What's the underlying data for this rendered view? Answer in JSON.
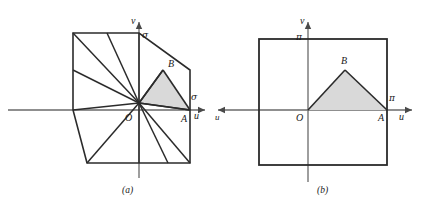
{
  "figure": {
    "background_color": "#ffffff",
    "stroke_color": "#2b2b2b",
    "axis_color": "#555555",
    "shade_color": "#d8d8d8",
    "panels": [
      {
        "id": "panel-a",
        "caption": "(a)",
        "origin_label": "O",
        "axis_x_label": "u",
        "axis_y_label": "v",
        "tick_y_label": "σ",
        "tick_x_label": "σ",
        "point_a_label": "A",
        "point_b_label": "B",
        "shape": "octagon-with-radial-fan",
        "shaded_region": "triangle-OAB"
      },
      {
        "id": "panel-b",
        "caption": "(b)",
        "origin_label": "O",
        "axis_x_label": "u",
        "axis_y_label": "v",
        "tick_y_label": "π",
        "tick_x_label": "π",
        "point_a_label": "A",
        "point_b_label": "B",
        "shape": "square",
        "shaded_region": "triangle-OAB"
      }
    ]
  }
}
